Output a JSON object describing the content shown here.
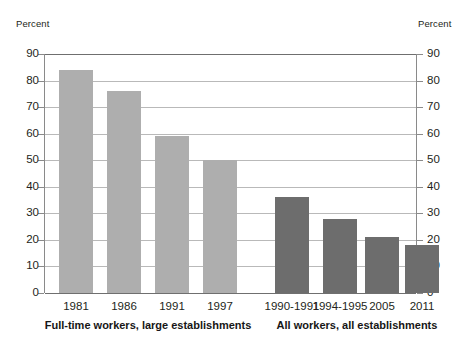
{
  "axes": {
    "left_unit_label": "Percent",
    "right_unit_label": "Percent",
    "ticks": [
      "90",
      "80",
      "70",
      "60",
      "50",
      "40",
      "30",
      "20",
      "10",
      "0"
    ]
  },
  "groups": [
    {
      "label": "Full-time workers, large establishments"
    },
    {
      "label": "All workers, all establishments"
    }
  ],
  "bars": [
    {
      "category": "1981",
      "value": 84,
      "group": 0,
      "shade": "light"
    },
    {
      "category": "1986",
      "value": 76,
      "group": 0,
      "shade": "light"
    },
    {
      "category": "1991",
      "value": 59,
      "group": 0,
      "shade": "light"
    },
    {
      "category": "1997",
      "value": 50,
      "group": 0,
      "shade": "light"
    },
    {
      "category": "1990-1991",
      "value": 36,
      "group": 1,
      "shade": "dark"
    },
    {
      "category": "1994-1995",
      "value": 28,
      "group": 1,
      "shade": "dark"
    },
    {
      "category": "2005",
      "value": 21,
      "group": 1,
      "shade": "dark"
    },
    {
      "category": "2011",
      "value": 18,
      "group": 1,
      "shade": "dark"
    }
  ],
  "chart_data": {
    "type": "bar",
    "title": "",
    "xlabel": "",
    "ylabel": "Percent",
    "ylim": [
      0,
      90
    ],
    "ytick_step": 10,
    "yticks": [
      0,
      10,
      20,
      30,
      40,
      50,
      60,
      70,
      80,
      90
    ],
    "grid": true,
    "dual_axis": true,
    "right_ylabel": "Percent",
    "legend": "none",
    "categories": [
      "1981",
      "1986",
      "1991",
      "1997",
      "1990-1991",
      "1994-1995",
      "2005",
      "2011"
    ],
    "values": [
      84,
      76,
      59,
      50,
      36,
      28,
      21,
      18
    ],
    "groups": [
      {
        "name": "Full-time workers, large establishments",
        "color": "#aeaeae",
        "categories": [
          "1981",
          "1986",
          "1991",
          "1997"
        ],
        "values": [
          84,
          76,
          59,
          50
        ]
      },
      {
        "name": "All workers, all establishments",
        "color": "#6d6d6d",
        "categories": [
          "1990-1991",
          "1994-1995",
          "2005",
          "2011"
        ],
        "values": [
          36,
          28,
          21,
          18
        ]
      }
    ]
  },
  "colors": {
    "bar_light": "#aeaeae",
    "bar_dark": "#6d6d6d",
    "gridline": "#b9b9b9",
    "axis": "#8a8a8a",
    "text": "#231f20",
    "background": "#ffffff"
  }
}
